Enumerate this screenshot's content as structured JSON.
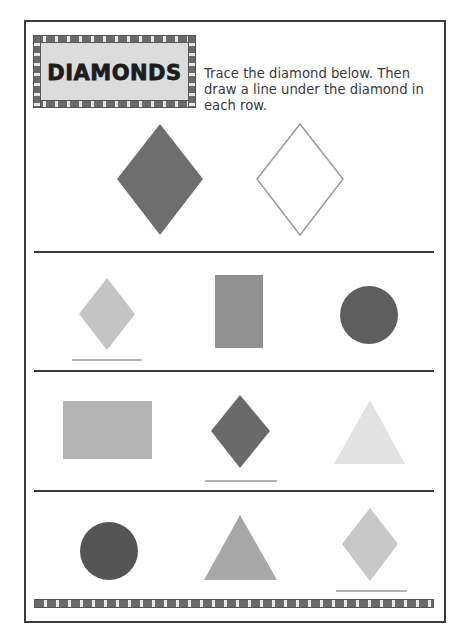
{
  "worksheet": {
    "title": "DIAMONDS",
    "instructions": "Trace the diamond below. Then draw a line under the diamond in each row."
  },
  "example": {
    "shapes": [
      {
        "name": "filled-diamond",
        "type": "diamond",
        "fill": "#6e6e6e"
      },
      {
        "name": "trace-diamond-outline",
        "type": "diamond",
        "fill": "none",
        "stroke": "#9a9a9a"
      }
    ]
  },
  "rows": [
    {
      "shapes": [
        {
          "type": "diamond",
          "fill": "#c4c4c4",
          "underlined": true
        },
        {
          "type": "rectangle",
          "fill": "#909090",
          "underlined": false
        },
        {
          "type": "circle",
          "fill": "#5e5e5e",
          "underlined": false
        }
      ]
    },
    {
      "shapes": [
        {
          "type": "rectangle",
          "fill": "#b4b4b4",
          "underlined": false
        },
        {
          "type": "diamond",
          "fill": "#6a6a6a",
          "underlined": true
        },
        {
          "type": "triangle",
          "fill": "#e2e2e2",
          "underlined": false
        }
      ]
    },
    {
      "shapes": [
        {
          "type": "circle",
          "fill": "#555555",
          "underlined": false
        },
        {
          "type": "triangle",
          "fill": "#a8a8a8",
          "underlined": false
        },
        {
          "type": "diamond",
          "fill": "#c8c8c8",
          "underlined": true
        }
      ]
    }
  ],
  "colors": {
    "border": "#3a3a3a",
    "underline": "#9a9a9a",
    "title_bg": "#dcdcdc"
  }
}
